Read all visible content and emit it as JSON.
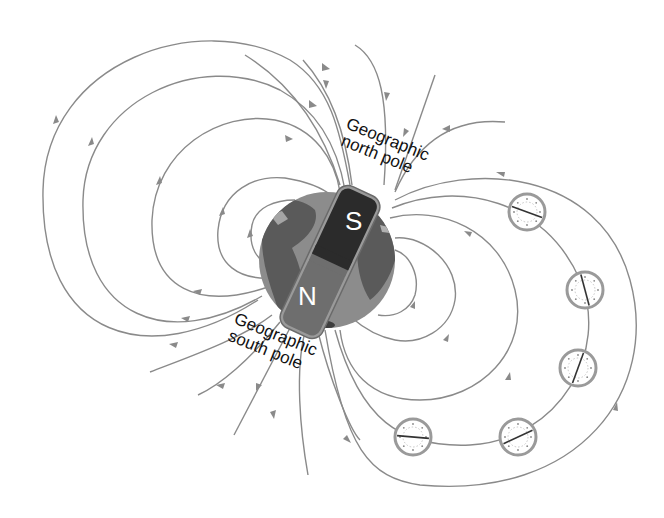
{
  "diagram": {
    "labels": {
      "north_line1": "Geographic",
      "north_line2": "north pole",
      "south_line1": "Geographic",
      "south_line2": "south pole"
    },
    "magnet": {
      "top_pole": "S",
      "bottom_pole": "N",
      "top_color": "#2b2b2b",
      "bottom_color": "#6e6e6e"
    },
    "earth": {
      "ocean_color": "#8c8c8c",
      "land_color": "#5a5a5a"
    },
    "colors": {
      "field_line": "#8a8a8a",
      "text": "#111111",
      "background": "#ffffff"
    },
    "compasses": [
      {
        "id": 1,
        "cx": 527,
        "cy": 212,
        "needle_angle": 20
      },
      {
        "id": 2,
        "cx": 585,
        "cy": 290,
        "needle_angle": 75
      },
      {
        "id": 3,
        "cx": 578,
        "cy": 368,
        "needle_angle": 110
      },
      {
        "id": 4,
        "cx": 518,
        "cy": 437,
        "needle_angle": 155
      },
      {
        "id": 5,
        "cx": 413,
        "cy": 437,
        "needle_angle": 185
      }
    ]
  }
}
